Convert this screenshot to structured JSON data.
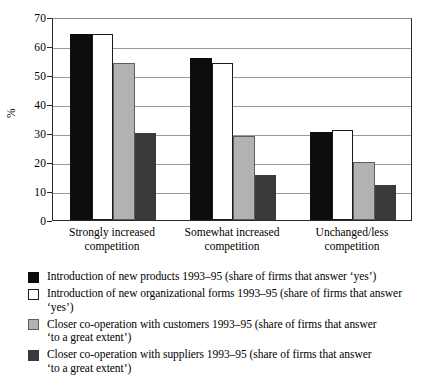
{
  "chart_data": {
    "type": "bar",
    "title": "",
    "xlabel": "",
    "ylabel": "%",
    "ylim": [
      0,
      70
    ],
    "yticks": [
      0,
      10,
      20,
      30,
      40,
      50,
      60,
      70
    ],
    "grid": true,
    "legend_position": "below",
    "categories": [
      "Strongly increased competition",
      "Somewhat increased competition",
      "Unchanged/less competition"
    ],
    "category_lines": [
      [
        "Strongly increased",
        "competition"
      ],
      [
        "Somewhat increased",
        "competition"
      ],
      [
        "Unchanged/less",
        "competition"
      ]
    ],
    "series": [
      {
        "name": "Introduction of new products 1993–95 (share of firms that answer ‘yes’)",
        "color": "#0d0d0d",
        "values": [
          64,
          56,
          30.5
        ]
      },
      {
        "name": "Introduction of new organizational forms 1993–95 (share of firms that answer ‘yes’)",
        "color": "#ffffff",
        "values": [
          64,
          54,
          31
        ]
      },
      {
        "name": "Closer co-operation with customers 1993–95 (share of firms that answer ‘to a great extent’)",
        "color": "#b2b2b2",
        "values": [
          54,
          29,
          20
        ]
      },
      {
        "name": "Closer co-operation with suppliers 1993–95 (share of firms that answer ‘to a great extent’)",
        "color": "#3a3a3a",
        "values": [
          30,
          15.5,
          12
        ]
      }
    ]
  },
  "legend": {
    "entries": [
      {
        "swatch": "black-square-swatch",
        "line1": "Introduction of new products 1993–95 (share of firms that answer ‘yes’)",
        "line2": ""
      },
      {
        "swatch": "white-square-swatch",
        "line1": "Introduction of new organizational forms 1993–95 (share of firms that answer ‘yes’)",
        "line2": ""
      },
      {
        "swatch": "light-gray-square-swatch",
        "line1": "Closer co-operation with customers 1993–95 (share of firms that answer",
        "line2": "‘to a great extent’)"
      },
      {
        "swatch": "dark-gray-square-swatch",
        "line1": "Closer co-operation with suppliers 1993–95 (share of firms that answer",
        "line2": "‘to a great extent’)"
      }
    ]
  }
}
